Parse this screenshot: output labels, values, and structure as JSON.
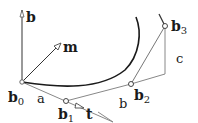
{
  "diagram": {
    "points": {
      "b0": {
        "label": "b",
        "sub": "0",
        "x": 22,
        "y": 82
      },
      "b1": {
        "label": "b",
        "sub": "1",
        "x": 66,
        "y": 101
      },
      "b2": {
        "label": "b",
        "sub": "2",
        "x": 131,
        "y": 84
      },
      "b3": {
        "label": "b",
        "sub": "3",
        "x": 165,
        "y": 26
      }
    },
    "vectors": {
      "binormal": {
        "label": "b"
      },
      "normal": {
        "label": "m"
      },
      "tangent": {
        "label": "t"
      }
    },
    "segment_labels": {
      "a": "a",
      "b": "b",
      "c": "c"
    },
    "colors": {
      "curve": "#1a1a1a",
      "polygon": "#888888",
      "vector": "#555555"
    }
  }
}
